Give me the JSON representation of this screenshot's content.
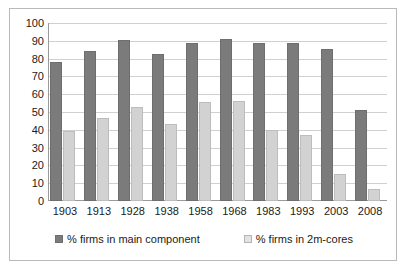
{
  "chart_data": {
    "type": "bar",
    "title": "",
    "subtitle": "",
    "xlabel": "",
    "ylabel": "",
    "ylim": [
      0,
      100
    ],
    "ytick_step": 10,
    "yticks": [
      100,
      90,
      80,
      70,
      60,
      50,
      40,
      30,
      20,
      10,
      0
    ],
    "grid": true,
    "legend_position": "bottom",
    "categories": [
      "1903",
      "1913",
      "1928",
      "1938",
      "1958",
      "1968",
      "1983",
      "1993",
      "2003",
      "2008"
    ],
    "series": [
      {
        "name": "% firms in main component",
        "color": "#7b7b7b",
        "values": [
          78,
          84,
          90.5,
          82.5,
          89,
          91,
          88.5,
          88.5,
          85.5,
          51
        ]
      },
      {
        "name": "% firms in 2m-cores",
        "color": "#d2d2d2",
        "values": [
          39.5,
          46.5,
          53,
          43,
          55.5,
          56,
          40,
          37,
          15,
          7
        ]
      }
    ]
  },
  "legend": {
    "items": [
      {
        "label": "% firms in main component"
      },
      {
        "label": "% firms in 2m-cores"
      }
    ]
  }
}
